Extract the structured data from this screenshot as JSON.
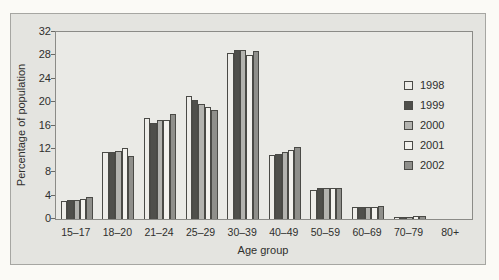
{
  "colors": {
    "page_bg": "#fbfaf6",
    "panel_bg": "#e4e4e0",
    "panel_border": "#a6a6a2",
    "plot_bg": "#eaeae6",
    "plot_border": "#8b8b87",
    "bar_border": "#4a4a46",
    "text": "#2f2f2d"
  },
  "chart_data": {
    "type": "bar",
    "title": "",
    "xlabel": "Age group",
    "ylabel": "Percentage of population",
    "ylim": [
      0,
      32
    ],
    "yticks": [
      0,
      4,
      8,
      12,
      16,
      20,
      24,
      28,
      32
    ],
    "grid": false,
    "legend_position": "inside-right",
    "categories": [
      "15–17",
      "18–20",
      "21–24",
      "25–29",
      "30–39",
      "40–49",
      "50–59",
      "60–69",
      "70–79",
      "80+"
    ],
    "series": [
      {
        "name": "1998",
        "color": "#eeede9",
        "values": [
          3.1,
          11.4,
          17.3,
          21.0,
          28.4,
          11.0,
          5.0,
          2.0,
          0.3,
          0
        ]
      },
      {
        "name": "1999",
        "color": "#4f4f4b",
        "values": [
          3.2,
          11.4,
          16.5,
          20.3,
          29.0,
          11.2,
          5.3,
          2.0,
          0.3,
          0
        ]
      },
      {
        "name": "2000",
        "color": "#b3b3af",
        "values": [
          3.2,
          11.6,
          16.9,
          19.7,
          28.9,
          11.5,
          5.3,
          2.0,
          0.4,
          0
        ]
      },
      {
        "name": "2001",
        "color": "#f3f2ee",
        "values": [
          3.4,
          12.2,
          16.9,
          19.1,
          28.1,
          11.8,
          5.3,
          2.1,
          0.5,
          0
        ]
      },
      {
        "name": "2002",
        "color": "#8f8f8b",
        "values": [
          3.7,
          10.8,
          18.0,
          18.7,
          28.8,
          12.4,
          5.3,
          2.3,
          0.6,
          0
        ]
      }
    ]
  }
}
